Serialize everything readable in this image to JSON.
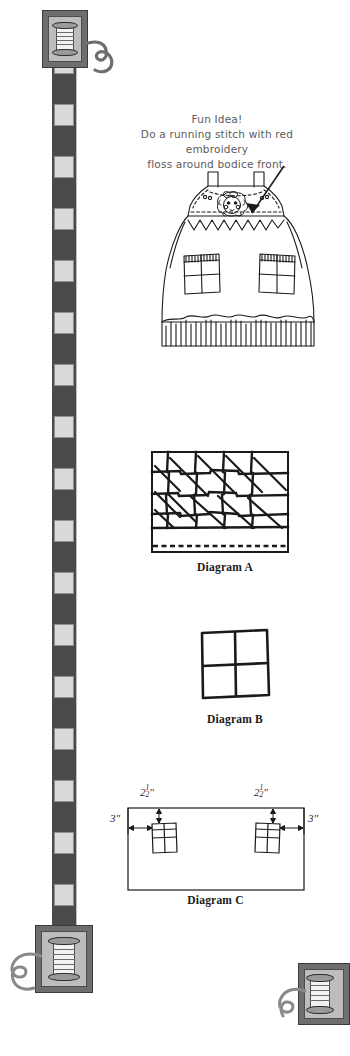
{
  "page": {
    "width": 329,
    "height": 1056,
    "background": "#ffffff",
    "ink": "#1a1a1a",
    "note_color": "#5b5b5b",
    "ribbon_dark": "#4a4a4a",
    "ribbon_light": "#d9d9d9"
  },
  "note": {
    "line1": "Fun Idea!",
    "line2": "Do a running stitch with red embroidery",
    "line3": "floss around bodice front."
  },
  "illustration": {
    "name": "pinafore-dress",
    "description": "Hand-drawn jumper dress with two shoulder straps, bodice with flower appliqué of a girl's face, two patch pockets and a ruffled hem"
  },
  "diagrams": [
    {
      "id": "A",
      "caption": "Diagram A",
      "kind": "patchwork-grid-with-diagonals",
      "rows": 4,
      "cols": 5,
      "has_dashed_edge": true
    },
    {
      "id": "B",
      "caption": "Diagram B",
      "kind": "four-patch-square",
      "rows": 2,
      "cols": 2
    },
    {
      "id": "C",
      "caption": "Diagram C",
      "kind": "placement-layout",
      "pockets": 2,
      "dimensions": [
        {
          "name": "top-offset-left",
          "value": "2",
          "fraction_num": "1",
          "fraction_den": "2",
          "unit": "\""
        },
        {
          "name": "top-offset-right",
          "value": "2",
          "fraction_num": "1",
          "fraction_den": "2",
          "unit": "\""
        },
        {
          "name": "side-offset-left",
          "value": "3",
          "fraction_num": "",
          "fraction_den": "",
          "unit": "\""
        },
        {
          "name": "side-offset-right",
          "value": "3",
          "fraction_num": "",
          "fraction_den": "",
          "unit": "\""
        }
      ]
    }
  ],
  "ornaments": [
    {
      "name": "spool-top-left",
      "type": "thread-spool"
    },
    {
      "name": "spool-bottom-left",
      "type": "thread-spool"
    },
    {
      "name": "spool-bottom-right",
      "type": "thread-spool"
    }
  ],
  "ribbon": {
    "name": "checkered-ribbon",
    "square_count": 17
  }
}
